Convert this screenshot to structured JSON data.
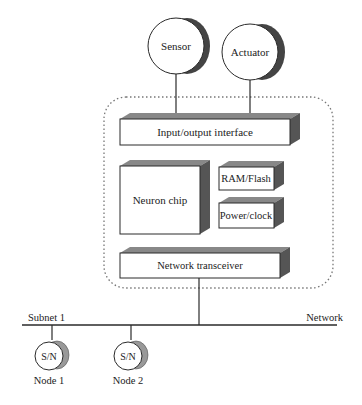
{
  "diagram": {
    "top_devices": [
      {
        "label": "Sensor"
      },
      {
        "label": "Actuator"
      }
    ],
    "node_components": {
      "io": "Input/output interface",
      "neuron": "Neuron chip",
      "ram": "RAM/Flash",
      "power": "Power/clock",
      "transceiver": "Network transceiver"
    },
    "bus": {
      "left_label": "Subnet 1",
      "right_label": "Network"
    },
    "subnet_nodes": [
      {
        "symbol": "S/N",
        "label": "Node 1"
      },
      {
        "symbol": "S/N",
        "label": "Node 2"
      }
    ],
    "colors": {
      "line": "#2a2a2a",
      "shade_dark": "#555555",
      "shade_mid": "#888888",
      "dotted_border": "#777777"
    }
  }
}
